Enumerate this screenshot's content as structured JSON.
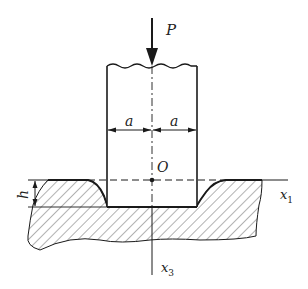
{
  "diagram": {
    "labels": {
      "load": "P",
      "half_width_left": "a",
      "half_width_right": "a",
      "origin": "O",
      "depth": "h",
      "axis_horizontal": "x",
      "axis_horizontal_sub": "1",
      "axis_vertical": "x",
      "axis_vertical_sub": "3"
    },
    "colors": {
      "stroke": "#1a1a1a",
      "hatch": "#555555",
      "background": "#ffffff"
    }
  }
}
